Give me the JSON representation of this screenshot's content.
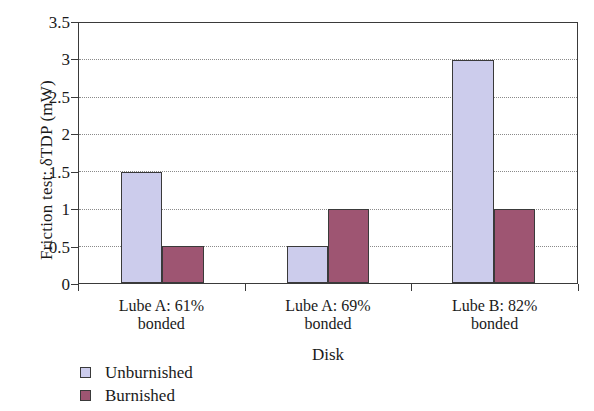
{
  "chart_data": {
    "type": "bar",
    "title": "",
    "xlabel": "Disk",
    "ylabel": "Friction test: δTDP (mW)",
    "categories": [
      "Lube A: 61%\nbonded",
      "Lube A: 69%\nbonded",
      "Lube B: 82%\nbonded"
    ],
    "category_lines": [
      [
        "Lube A: 61%",
        "bonded"
      ],
      [
        "Lube A: 69%",
        "bonded"
      ],
      [
        "Lube B: 82%",
        "bonded"
      ]
    ],
    "series": [
      {
        "name": "Unburnished",
        "values": [
          1.5,
          0.5,
          3.0
        ],
        "color": "#ccccec"
      },
      {
        "name": "Burnished",
        "values": [
          0.5,
          1.0,
          1.0
        ],
        "color": "#9e5572"
      }
    ],
    "ylim": [
      0,
      3.5
    ],
    "yticks": [
      0,
      0.5,
      1,
      1.5,
      2,
      2.5,
      3,
      3.5
    ],
    "ytick_labels": [
      "0",
      "0.5",
      "1",
      "1.5",
      "2",
      "2.5",
      "3",
      "3.5"
    ],
    "grid": true,
    "grid_axis": "y",
    "legend_position": "below-left",
    "frame": true
  },
  "legend": {
    "entries": [
      {
        "label": "Unburnished",
        "color": "#ccccec"
      },
      {
        "label": "Burnished",
        "color": "#9e5572"
      }
    ]
  },
  "axis": {
    "y_title": "Friction test: δTDP (mW)",
    "x_title": "Disk"
  }
}
